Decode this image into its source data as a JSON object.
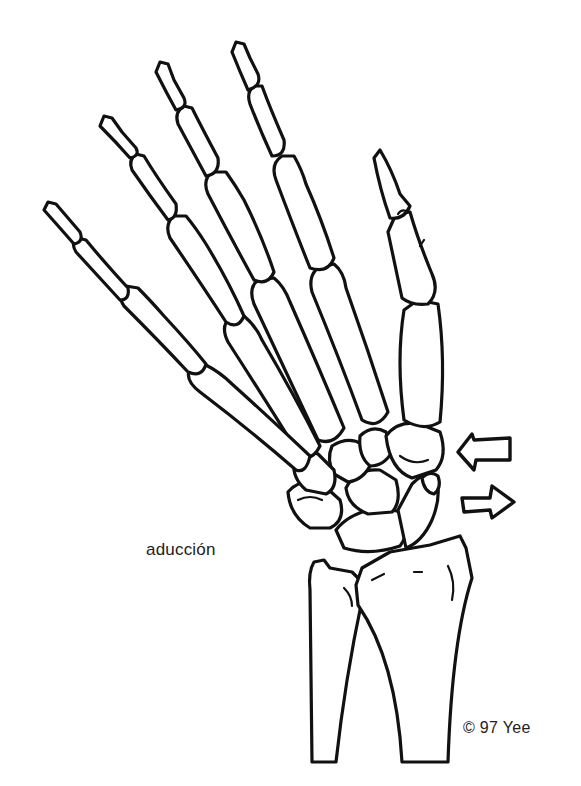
{
  "figure": {
    "labels": {
      "movement": "aducción",
      "copyright": "© 97 Yee"
    },
    "arrows": [
      {
        "direction": "left",
        "position": "upper"
      },
      {
        "direction": "right",
        "position": "lower"
      }
    ],
    "colors": {
      "line": "#111111",
      "background": "#ffffff",
      "text": "#222222"
    }
  }
}
